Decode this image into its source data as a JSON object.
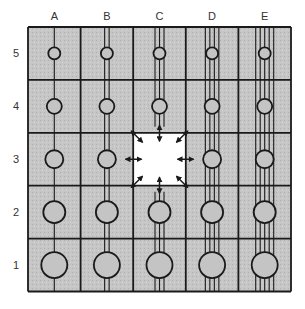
{
  "diagram": {
    "type": "grid-diagram",
    "columns": [
      {
        "label": "A",
        "lines": 1
      },
      {
        "label": "B",
        "lines": 2
      },
      {
        "label": "C",
        "lines": 3
      },
      {
        "label": "D",
        "lines": 4
      },
      {
        "label": "E",
        "lines": 5
      }
    ],
    "rows": [
      {
        "label": "5",
        "circle_radius": 6
      },
      {
        "label": "4",
        "circle_radius": 7.5
      },
      {
        "label": "3",
        "circle_radius": 9
      },
      {
        "label": "2",
        "circle_radius": 11
      },
      {
        "label": "1",
        "circle_radius": 13
      }
    ],
    "highlighted_cell": {
      "column": "C",
      "row": "3",
      "fill": "#ffffff",
      "arrows": 8,
      "arrow_style": "double-headed radiating outward"
    },
    "colors": {
      "cell_fill": "#c8c8c8",
      "stroke": "#1a1a1a",
      "background": "#ffffff"
    }
  }
}
